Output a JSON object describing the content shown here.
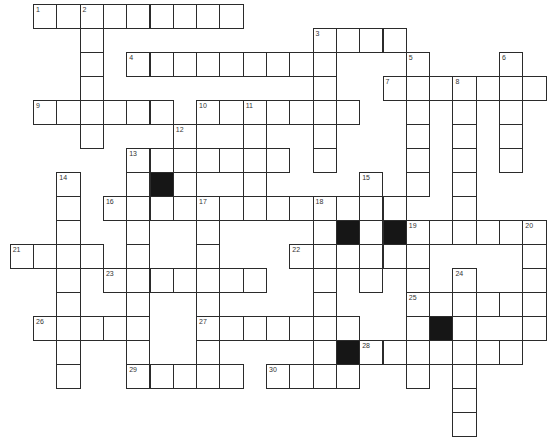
{
  "puzzle": {
    "title": "Crossword grid",
    "grid": {
      "origin_x": 9.7,
      "origin_y": 4,
      "cell_w": 23.3,
      "cell_h": 24,
      "columns": 23,
      "rows": 18
    },
    "colors": {
      "line": "#2b2b2b",
      "block": "#161616",
      "fill": "#ffffff"
    },
    "rows": [
      {
        "r": 0,
        "cells": [
          [
            1,
            "1"
          ],
          [
            2,
            ""
          ],
          [
            3,
            "2"
          ],
          [
            4,
            ""
          ],
          [
            5,
            ""
          ],
          [
            6,
            ""
          ],
          [
            7,
            ""
          ],
          [
            8,
            ""
          ],
          [
            9,
            ""
          ]
        ]
      },
      {
        "r": 1,
        "cells": [
          [
            3,
            ""
          ],
          [
            13,
            "3"
          ],
          [
            14,
            ""
          ],
          [
            15,
            ""
          ],
          [
            16,
            ""
          ]
        ]
      },
      {
        "r": 2,
        "cells": [
          [
            3,
            ""
          ],
          [
            5,
            "4"
          ],
          [
            6,
            ""
          ],
          [
            7,
            ""
          ],
          [
            8,
            ""
          ],
          [
            9,
            ""
          ],
          [
            10,
            ""
          ],
          [
            11,
            ""
          ],
          [
            12,
            ""
          ],
          [
            13,
            ""
          ],
          [
            17,
            "5"
          ],
          [
            21,
            "6"
          ]
        ]
      },
      {
        "r": 3,
        "cells": [
          [
            3,
            ""
          ],
          [
            13,
            ""
          ],
          [
            16,
            "7"
          ],
          [
            17,
            ""
          ],
          [
            18,
            ""
          ],
          [
            19,
            "8"
          ],
          [
            20,
            ""
          ],
          [
            21,
            ""
          ],
          [
            22,
            ""
          ]
        ]
      },
      {
        "r": 4,
        "cells": [
          [
            1,
            "9"
          ],
          [
            2,
            ""
          ],
          [
            3,
            ""
          ],
          [
            4,
            ""
          ],
          [
            5,
            ""
          ],
          [
            6,
            ""
          ],
          [
            8,
            "10"
          ],
          [
            9,
            ""
          ],
          [
            10,
            "11"
          ],
          [
            11,
            ""
          ],
          [
            12,
            ""
          ],
          [
            13,
            ""
          ],
          [
            14,
            ""
          ],
          [
            17,
            ""
          ],
          [
            19,
            ""
          ],
          [
            21,
            ""
          ]
        ]
      },
      {
        "r": 5,
        "cells": [
          [
            3,
            ""
          ],
          [
            7,
            "12"
          ],
          [
            10,
            ""
          ],
          [
            13,
            ""
          ],
          [
            17,
            ""
          ],
          [
            19,
            ""
          ],
          [
            21,
            ""
          ]
        ]
      },
      {
        "r": 6,
        "cells": [
          [
            5,
            "13"
          ],
          [
            6,
            ""
          ],
          [
            7,
            ""
          ],
          [
            8,
            ""
          ],
          [
            9,
            ""
          ],
          [
            10,
            ""
          ],
          [
            11,
            ""
          ],
          [
            13,
            ""
          ],
          [
            17,
            ""
          ],
          [
            19,
            ""
          ],
          [
            21,
            ""
          ]
        ]
      },
      {
        "r": 7,
        "cells": [
          [
            2,
            "14"
          ],
          [
            5,
            ""
          ],
          [
            6,
            "#"
          ],
          [
            7,
            ""
          ],
          [
            10,
            ""
          ],
          [
            15,
            "15"
          ],
          [
            17,
            ""
          ],
          [
            19,
            ""
          ]
        ]
      },
      {
        "r": 8,
        "cells": [
          [
            2,
            ""
          ],
          [
            4,
            "16"
          ],
          [
            5,
            ""
          ],
          [
            6,
            ""
          ],
          [
            7,
            ""
          ],
          [
            8,
            "17"
          ],
          [
            9,
            ""
          ],
          [
            10,
            ""
          ],
          [
            11,
            ""
          ],
          [
            12,
            ""
          ],
          [
            13,
            "18"
          ],
          [
            14,
            ""
          ],
          [
            15,
            ""
          ],
          [
            16,
            ""
          ],
          [
            19,
            ""
          ]
        ]
      },
      {
        "r": 9,
        "cells": [
          [
            2,
            ""
          ],
          [
            5,
            ""
          ],
          [
            8,
            ""
          ],
          [
            13,
            ""
          ],
          [
            14,
            "#"
          ],
          [
            15,
            ""
          ],
          [
            16,
            "#"
          ],
          [
            17,
            "19"
          ],
          [
            18,
            ""
          ],
          [
            19,
            ""
          ],
          [
            20,
            ""
          ],
          [
            21,
            ""
          ],
          [
            22,
            "20"
          ]
        ]
      },
      {
        "r": 10,
        "cells": [
          [
            0,
            "21"
          ],
          [
            1,
            ""
          ],
          [
            2,
            ""
          ],
          [
            3,
            ""
          ],
          [
            5,
            ""
          ],
          [
            8,
            ""
          ],
          [
            12,
            "22"
          ],
          [
            13,
            ""
          ],
          [
            14,
            ""
          ],
          [
            15,
            ""
          ],
          [
            16,
            ""
          ],
          [
            17,
            ""
          ],
          [
            22,
            ""
          ]
        ]
      },
      {
        "r": 11,
        "cells": [
          [
            2,
            ""
          ],
          [
            4,
            "23"
          ],
          [
            5,
            ""
          ],
          [
            6,
            ""
          ],
          [
            7,
            ""
          ],
          [
            8,
            ""
          ],
          [
            9,
            ""
          ],
          [
            10,
            ""
          ],
          [
            13,
            ""
          ],
          [
            15,
            ""
          ],
          [
            17,
            ""
          ],
          [
            19,
            "24"
          ],
          [
            22,
            ""
          ]
        ]
      },
      {
        "r": 12,
        "cells": [
          [
            2,
            ""
          ],
          [
            5,
            ""
          ],
          [
            8,
            ""
          ],
          [
            13,
            ""
          ],
          [
            17,
            "25"
          ],
          [
            18,
            ""
          ],
          [
            19,
            ""
          ],
          [
            20,
            ""
          ],
          [
            21,
            ""
          ],
          [
            22,
            ""
          ]
        ]
      },
      {
        "r": 13,
        "cells": [
          [
            1,
            "26"
          ],
          [
            2,
            ""
          ],
          [
            3,
            ""
          ],
          [
            4,
            ""
          ],
          [
            5,
            ""
          ],
          [
            8,
            "27"
          ],
          [
            9,
            ""
          ],
          [
            10,
            ""
          ],
          [
            11,
            ""
          ],
          [
            12,
            ""
          ],
          [
            13,
            ""
          ],
          [
            14,
            ""
          ],
          [
            17,
            ""
          ],
          [
            18,
            "#"
          ],
          [
            19,
            ""
          ],
          [
            22,
            ""
          ]
        ]
      },
      {
        "r": 14,
        "cells": [
          [
            2,
            ""
          ],
          [
            5,
            ""
          ],
          [
            8,
            ""
          ],
          [
            13,
            ""
          ],
          [
            14,
            "#"
          ],
          [
            15,
            "28"
          ],
          [
            16,
            ""
          ],
          [
            17,
            ""
          ],
          [
            18,
            ""
          ],
          [
            19,
            ""
          ],
          [
            20,
            ""
          ],
          [
            21,
            ""
          ]
        ]
      },
      {
        "r": 15,
        "cells": [
          [
            2,
            ""
          ],
          [
            5,
            "29"
          ],
          [
            6,
            ""
          ],
          [
            7,
            ""
          ],
          [
            8,
            ""
          ],
          [
            9,
            ""
          ],
          [
            11,
            "30"
          ],
          [
            12,
            ""
          ],
          [
            13,
            ""
          ],
          [
            14,
            ""
          ],
          [
            17,
            ""
          ],
          [
            19,
            ""
          ]
        ]
      },
      {
        "r": 16,
        "cells": [
          [
            19,
            ""
          ]
        ]
      },
      {
        "r": 17,
        "cells": [
          [
            19,
            ""
          ]
        ]
      }
    ],
    "clue_numbers": [
      "1",
      "2",
      "3",
      "4",
      "5",
      "6",
      "7",
      "8",
      "9",
      "10",
      "11",
      "12",
      "13",
      "14",
      "15",
      "16",
      "17",
      "18",
      "19",
      "20",
      "21",
      "22",
      "23",
      "24",
      "25",
      "26",
      "27",
      "28",
      "29",
      "30"
    ]
  }
}
